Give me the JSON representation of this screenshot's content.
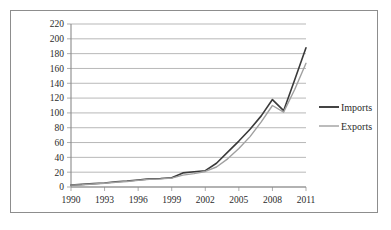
{
  "chart_data": {
    "type": "line",
    "title": "",
    "subtitle": "",
    "xlabel": "",
    "ylabel": "",
    "x": [
      1990,
      1991,
      1992,
      1993,
      1994,
      1995,
      1996,
      1997,
      1998,
      1999,
      2000,
      2001,
      2002,
      2003,
      2004,
      2005,
      2006,
      2007,
      2008,
      2009,
      2010,
      2011
    ],
    "xlim": [
      1990,
      2011
    ],
    "ylim": [
      0,
      220
    ],
    "ytick_labels": [
      "0",
      "20",
      "40",
      "60",
      "80",
      "100",
      "120",
      "140",
      "160",
      "180",
      "200",
      "220"
    ],
    "ytick_values": [
      0,
      20,
      40,
      60,
      80,
      100,
      120,
      140,
      160,
      180,
      200,
      220
    ],
    "xtick_labels": [
      "1990",
      "1993",
      "1996",
      "1999",
      "2002",
      "2005",
      "2008",
      "2011"
    ],
    "xtick_values": [
      1990,
      1993,
      1996,
      1999,
      2002,
      2005,
      2008,
      2011
    ],
    "grid": "horizontal",
    "legend_position": "right",
    "series": [
      {
        "name": "Imports",
        "color": "#3a3a3a",
        "values": [
          2.5,
          3.5,
          4.5,
          5.5,
          7,
          8,
          9.5,
          11,
          11.5,
          12.5,
          19,
          20.5,
          22,
          32,
          47,
          62,
          78,
          96,
          118,
          103,
          145,
          188
        ]
      },
      {
        "name": "Exports",
        "color": "#a0a0a0",
        "values": [
          2.5,
          3,
          4,
          5,
          6.5,
          7.5,
          9,
          10.5,
          11,
          12,
          16,
          18,
          21,
          27,
          38,
          52,
          68,
          88,
          110,
          101,
          132,
          167
        ]
      }
    ]
  },
  "legend": {
    "entries": [
      {
        "label": "Imports"
      },
      {
        "label": "Exports"
      }
    ]
  },
  "axes": {
    "y_axis_name": "value-axis",
    "x_axis_name": "year-axis"
  }
}
